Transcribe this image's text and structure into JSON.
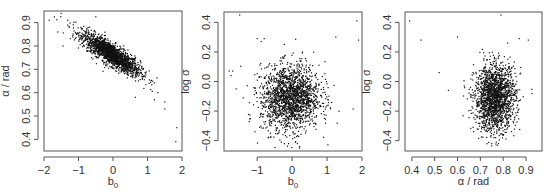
{
  "chart_data": [
    {
      "type": "scatter",
      "title": "",
      "xlabel": "b0",
      "ylabel": "α / rad",
      "xlim": [
        -2,
        2
      ],
      "ylim": [
        0.35,
        0.95
      ],
      "xticks": [
        -2,
        -1,
        0,
        1,
        2
      ],
      "xtick_labels": [
        "−2",
        "−1",
        "0",
        "1",
        "2"
      ],
      "yticks": [
        0.4,
        0.5,
        0.6,
        0.7,
        0.8,
        0.9
      ],
      "ytick_labels": [
        "0.4",
        "0.5",
        "0.6",
        "0.7",
        "0.8",
        "0.9"
      ],
      "grid": false,
      "legend": "none",
      "frame": {
        "left": 44,
        "top": 11,
        "right": 182,
        "bottom": 151
      },
      "n_points": 1800,
      "distribution": {
        "mean_x": -0.05,
        "mean_y": 0.765,
        "sd_x": 0.42,
        "sd_y": 0.045,
        "correlation": -0.85
      },
      "outliers": [
        [
          -1.85,
          0.91
        ],
        [
          -1.7,
          0.925
        ],
        [
          -1.5,
          0.94
        ],
        [
          -1.6,
          0.86
        ],
        [
          -1.45,
          0.8
        ],
        [
          -0.5,
          0.925
        ],
        [
          1.85,
          0.45
        ],
        [
          1.82,
          0.39
        ],
        [
          1.5,
          0.53
        ],
        [
          1.5,
          0.56
        ],
        [
          0.65,
          0.58
        ],
        [
          1.3,
          0.6
        ],
        [
          1.2,
          0.57
        ]
      ]
    },
    {
      "type": "scatter",
      "title": "",
      "xlabel": "b0",
      "ylabel": "log σ",
      "xlim": [
        -1.95,
        2
      ],
      "ylim": [
        -0.47,
        0.47
      ],
      "xticks": [
        -1,
        0,
        1,
        2
      ],
      "xtick_labels": [
        "−1",
        "0",
        "1",
        "2"
      ],
      "yticks": [
        -0.4,
        -0.2,
        0.0,
        0.2,
        0.4
      ],
      "ytick_labels": [
        "−0.4",
        "−0.2",
        "0.0",
        "0.2",
        "0.4"
      ],
      "grid": false,
      "legend": "none",
      "frame": {
        "left": 224,
        "top": 12,
        "right": 362,
        "bottom": 151
      },
      "n_points": 1800,
      "distribution": {
        "mean_x": -0.05,
        "mean_y": -0.11,
        "sd_x": 0.42,
        "sd_y": 0.11,
        "correlation": 0.05
      },
      "outliers": [
        [
          -1.5,
          0.45
        ],
        [
          1.85,
          0.41
        ],
        [
          1.9,
          0.28
        ],
        [
          1.25,
          0.3
        ],
        [
          -1.0,
          0.29
        ],
        [
          -0.8,
          0.29
        ],
        [
          -1.8,
          0.07
        ],
        [
          -1.7,
          0.07
        ],
        [
          -1.75,
          0.04
        ],
        [
          -1.6,
          -0.05
        ],
        [
          -1.4,
          -0.11
        ],
        [
          -0.1,
          -0.42
        ],
        [
          0.1,
          -0.41
        ],
        [
          0.15,
          -0.42
        ]
      ]
    },
    {
      "type": "scatter",
      "title": "",
      "xlabel": "α / rad",
      "ylabel": "log σ",
      "xlim": [
        0.37,
        0.97
      ],
      "ylim": [
        -0.47,
        0.47
      ],
      "xticks": [
        0.4,
        0.5,
        0.6,
        0.7,
        0.8,
        0.9
      ],
      "xtick_labels": [
        "0.4",
        "0.5",
        "0.6",
        "0.7",
        "0.8",
        "0.9"
      ],
      "yticks": [
        -0.4,
        -0.2,
        0.0,
        0.2,
        0.4
      ],
      "ytick_labels": [
        "−0.4",
        "−0.2",
        "0.0",
        "0.2",
        "0.4"
      ],
      "grid": false,
      "legend": "none",
      "frame": {
        "left": 405,
        "top": 12,
        "right": 542,
        "bottom": 151
      },
      "n_points": 1800,
      "distribution": {
        "mean_x": 0.765,
        "mean_y": -0.11,
        "sd_x": 0.045,
        "sd_y": 0.11,
        "correlation": 0.05
      },
      "outliers": [
        [
          0.39,
          0.41
        ],
        [
          0.44,
          0.28
        ],
        [
          0.52,
          0.06
        ],
        [
          0.6,
          0.3
        ],
        [
          0.79,
          0.45
        ],
        [
          0.91,
          0.28
        ],
        [
          0.87,
          0.29
        ],
        [
          0.56,
          -0.06
        ],
        [
          0.75,
          -0.42
        ],
        [
          0.77,
          -0.41
        ],
        [
          0.78,
          -0.42
        ]
      ]
    }
  ],
  "style": {
    "point_color": "#111111",
    "axis_color": "#555555",
    "text_color": "#333333",
    "background": "#ffffff"
  }
}
